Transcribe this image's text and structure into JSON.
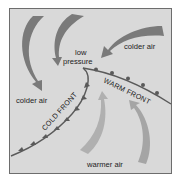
{
  "diagram": {
    "title": "",
    "labels": {
      "low_pressure_line1": "low",
      "low_pressure_line2": "pressure",
      "colder_air_top_right": "colder air",
      "colder_air_left": "colder air",
      "warmer_air_bottom": "warmer air",
      "cold_front": "COLD FRONT",
      "warm_front": "WARM FRONT"
    },
    "colors": {
      "background": "#d9d9d9",
      "cold_air_arrows": "#7a7a7a",
      "warm_air_arrows": "#b0b0b0",
      "front_lines": "#5a5a5a",
      "text": "#222222"
    },
    "arrows": [
      {
        "name": "colder-air-arrow-left",
        "direction": "down-right toward colder air region"
      },
      {
        "name": "colder-air-arrow-top",
        "direction": "down toward low pressure"
      },
      {
        "name": "colder-air-arrow-right",
        "direction": "left toward low pressure"
      },
      {
        "name": "warmer-air-arrow-left",
        "direction": "up toward warm front"
      },
      {
        "name": "warmer-air-arrow-right",
        "direction": "up toward warm front"
      }
    ]
  }
}
